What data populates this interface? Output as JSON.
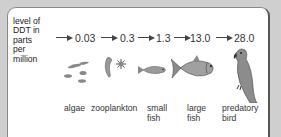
{
  "diagram": {
    "y_label": "level of DDT in parts per million",
    "y_label_lines": [
      "level of",
      "DDT in",
      "parts",
      "per",
      "million"
    ],
    "levels": [
      "0.03",
      "0.3",
      "1.3",
      "13.0",
      "28.0"
    ],
    "organisms": [
      {
        "name": "algae",
        "lines": [
          "algae"
        ],
        "icon": "algae-icon",
        "ddt_ppm": "0.03"
      },
      {
        "name": "zooplankton",
        "lines": [
          "zooplankton"
        ],
        "icon": "zooplankton-icon",
        "ddt_ppm": "0.3"
      },
      {
        "name": "small fish",
        "lines": [
          "small",
          "fish"
        ],
        "icon": "small-fish-icon",
        "ddt_ppm": "1.3"
      },
      {
        "name": "large fish",
        "lines": [
          "large",
          "fish"
        ],
        "icon": "large-fish-icon",
        "ddt_ppm": "13.0"
      },
      {
        "name": "predatory bird",
        "lines": [
          "predatory",
          "bird"
        ],
        "icon": "predatory-bird-icon",
        "ddt_ppm": "28.0"
      }
    ],
    "colors": {
      "background": "#cfcfcf",
      "panel": "#ffffff",
      "organism_fill": "#8c8c8c"
    }
  }
}
